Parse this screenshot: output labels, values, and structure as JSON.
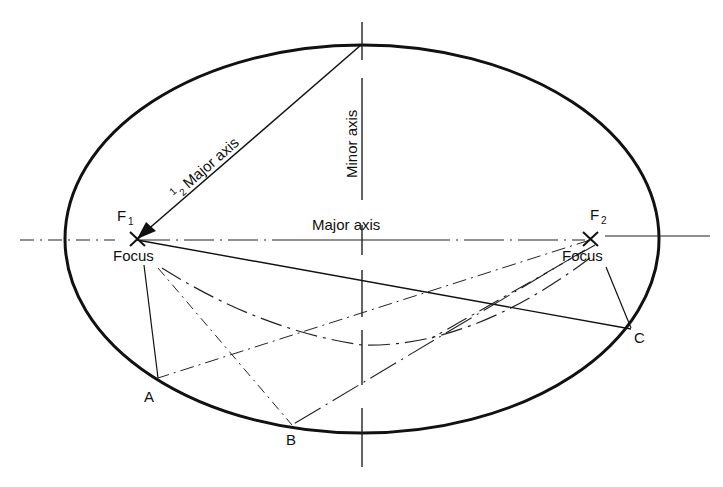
{
  "diagram": {
    "type": "ellipse-construction",
    "colors": {
      "stroke": "#111111",
      "background": "#ffffff"
    },
    "labels": {
      "half_major_prefix": "1",
      "half_major_sub": "2",
      "half_major_text": "Major axis",
      "minor_axis": "Minor axis",
      "major_axis": "Major axis",
      "f1_letter": "F",
      "f1_sub": "1",
      "f2_letter": "F",
      "f2_sub": "2",
      "focus_left": "Focus",
      "focus_right": "Focus",
      "point_a": "A",
      "point_b": "B",
      "point_c": "C"
    },
    "points": {
      "F1": [
        137,
        238
      ],
      "F2": [
        590,
        238
      ],
      "A": [
        158,
        379
      ],
      "B": [
        292,
        425
      ],
      "C": [
        631,
        329
      ],
      "minor_top": [
        362,
        46
      ],
      "minor_bottom": [
        362,
        433
      ]
    }
  }
}
